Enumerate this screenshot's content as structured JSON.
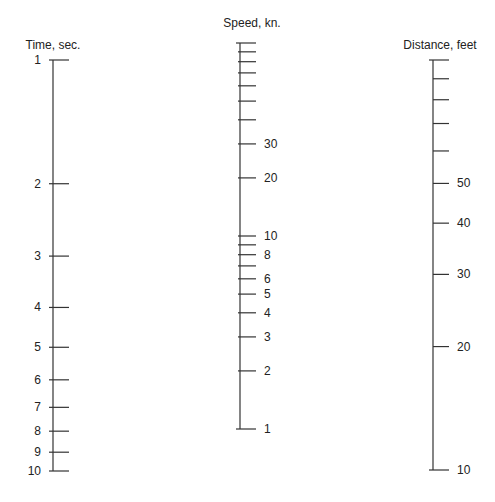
{
  "chart_data": {
    "type": "nomogram",
    "title": "",
    "scales": [
      {
        "id": "time",
        "title": "Time, sec.",
        "scale": "log",
        "range": [
          1,
          10
        ],
        "direction": "down-increasing",
        "ticks": [
          1,
          2,
          3,
          4,
          5,
          6,
          7,
          8,
          9,
          10
        ],
        "labels": [
          "1",
          "2",
          "3",
          "4",
          "5",
          "6",
          "7",
          "8",
          "9",
          "10"
        ],
        "tick_side": "right",
        "label_side": "left"
      },
      {
        "id": "speed",
        "title": "Speed, kn.",
        "scale": "log",
        "range": [
          1,
          100
        ],
        "direction": "up-increasing",
        "ticks": [
          1,
          2,
          3,
          4,
          5,
          6,
          7,
          8,
          9,
          10,
          20,
          30,
          40,
          50,
          60,
          70,
          80,
          90,
          100
        ],
        "labels": [
          "1",
          "2",
          "3",
          "4",
          "5",
          "6",
          "",
          "8",
          "",
          "10",
          "20",
          "30",
          "",
          "",
          "",
          "",
          "",
          "",
          ""
        ],
        "tick_side": "right",
        "label_side": "right"
      },
      {
        "id": "distance",
        "title": "Distance, feet",
        "scale": "log",
        "range": [
          10,
          100
        ],
        "direction": "up-increasing",
        "ticks": [
          10,
          20,
          30,
          40,
          50,
          60,
          70,
          80,
          90,
          100
        ],
        "labels": [
          "10",
          "20",
          "30",
          "40",
          "50",
          "",
          "",
          "",
          "",
          ""
        ],
        "tick_side": "right",
        "label_side": "right"
      }
    ]
  }
}
